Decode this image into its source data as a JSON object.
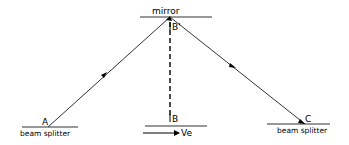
{
  "diagram": {
    "mirror_label": "mirror",
    "point_a_label": "A",
    "point_b_label": "B",
    "point_b_prime_label": "B'",
    "point_c_label": "C",
    "left_splitter_label": "beam splitter",
    "right_splitter_label": "beam splitter",
    "velocity_label": "Ve",
    "colors": {
      "line": "#000000",
      "background": "#ffffff"
    }
  }
}
